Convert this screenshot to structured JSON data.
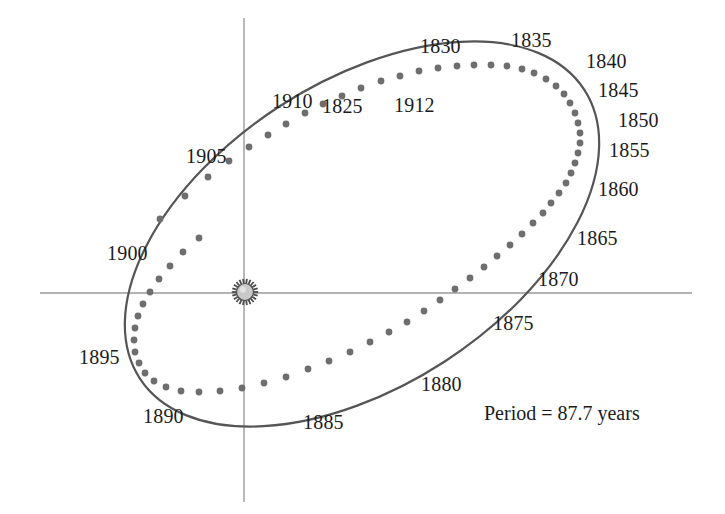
{
  "figure": {
    "background_color": "#ffffff",
    "axis_color": "#9a9a9a",
    "orbit_color": "#555555",
    "dot_color": "#6e6e6e",
    "text_color": "#1b1b1b",
    "sun_fill": "#c9c9c9",
    "sun_ray_color": "#4a4a4a"
  },
  "annotations": {
    "period": "Period = 87.7 years"
  },
  "icons": {
    "sun": "sun-icon"
  },
  "axes": {
    "horizontal": {
      "x1": 40,
      "y1": 293,
      "x2": 692,
      "y2": 293
    },
    "vertical": {
      "x1": 244,
      "y1": 18,
      "x2": 244,
      "y2": 502
    },
    "origin_label": "sun-at-focus"
  },
  "chart_data": {
    "type": "scatter",
    "subtitle": "Period = 87.7 years",
    "xlabel": "",
    "ylabel": "",
    "grid": false,
    "legend": null,
    "axis_style": "crosshair-through-focus",
    "focus_marker": {
      "name": "Sun",
      "x": 245,
      "y": 292,
      "symbol": "sun-icon"
    },
    "orbit_ellipse": {
      "center_x": 362,
      "center_y": 234,
      "semi_major": 265,
      "semi_minor": 152,
      "rotation_deg": -33,
      "leftmost": {
        "x": 133,
        "y": 330
      },
      "rightmost": {
        "x": 592,
        "y": 120
      },
      "topmost": {
        "x": 470,
        "y": 60
      },
      "bottommost": {
        "x": 250,
        "y": 407
      }
    },
    "year_labels": [
      {
        "year": "1825",
        "x": 322,
        "y": 96
      },
      {
        "year": "1830",
        "x": 420,
        "y": 36
      },
      {
        "year": "1835",
        "x": 511,
        "y": 30
      },
      {
        "year": "1840",
        "x": 586,
        "y": 51
      },
      {
        "year": "1845",
        "x": 598,
        "y": 80
      },
      {
        "year": "1850",
        "x": 618,
        "y": 110
      },
      {
        "year": "1855",
        "x": 609,
        "y": 140
      },
      {
        "year": "1860",
        "x": 598,
        "y": 179
      },
      {
        "year": "1865",
        "x": 577,
        "y": 228
      },
      {
        "year": "1870",
        "x": 538,
        "y": 269
      },
      {
        "year": "1875",
        "x": 493,
        "y": 313
      },
      {
        "year": "1880",
        "x": 421,
        "y": 374
      },
      {
        "year": "1885",
        "x": 303,
        "y": 412
      },
      {
        "year": "1890",
        "x": 143,
        "y": 406
      },
      {
        "year": "1895",
        "x": 79,
        "y": 347
      },
      {
        "year": "1900",
        "x": 107,
        "y": 243
      },
      {
        "year": "1905",
        "x": 186,
        "y": 146
      },
      {
        "year": "1910",
        "x": 272,
        "y": 91
      },
      {
        "year": "1912",
        "x": 394,
        "y": 95
      }
    ],
    "comet_positions_note": "Yearly comet positions along the elliptical orbit; dots are densely spaced near aphelion (right) and widely spaced near perihelion (left-bottom passage near the Sun).",
    "comet_dots": [
      [
        160,
        219
      ],
      [
        185,
        196
      ],
      [
        208,
        177
      ],
      [
        229,
        161
      ],
      [
        249,
        147
      ],
      [
        268,
        135
      ],
      [
        286,
        124
      ],
      [
        305,
        113
      ],
      [
        323,
        104
      ],
      [
        342,
        96
      ],
      [
        361,
        88
      ],
      [
        381,
        81
      ],
      [
        400,
        76
      ],
      [
        419,
        71
      ],
      [
        438,
        68
      ],
      [
        457,
        66
      ],
      [
        474,
        65
      ],
      [
        491,
        65
      ],
      [
        507,
        66
      ],
      [
        522,
        69
      ],
      [
        534,
        73
      ],
      [
        546,
        79
      ],
      [
        556,
        86
      ],
      [
        564,
        94
      ],
      [
        570,
        103
      ],
      [
        575,
        113
      ],
      [
        578,
        123
      ],
      [
        580,
        133
      ],
      [
        580,
        143
      ],
      [
        578,
        153
      ],
      [
        575,
        163
      ],
      [
        571,
        173
      ],
      [
        566,
        183
      ],
      [
        559,
        193
      ],
      [
        551,
        203
      ],
      [
        543,
        213
      ],
      [
        533,
        223
      ],
      [
        522,
        234
      ],
      [
        510,
        245
      ],
      [
        497,
        256
      ],
      [
        484,
        267
      ],
      [
        470,
        278
      ],
      [
        455,
        289
      ],
      [
        440,
        300
      ],
      [
        424,
        311
      ],
      [
        407,
        322
      ],
      [
        389,
        332
      ],
      [
        370,
        342
      ],
      [
        350,
        352
      ],
      [
        329,
        361
      ],
      [
        308,
        369
      ],
      [
        286,
        377
      ],
      [
        264,
        383
      ],
      [
        242,
        388
      ],
      [
        220,
        391
      ],
      [
        199,
        392
      ],
      [
        181,
        391
      ],
      [
        166,
        387
      ],
      [
        154,
        381
      ],
      [
        145,
        373
      ],
      [
        139,
        363
      ],
      [
        135,
        352
      ],
      [
        134,
        340
      ],
      [
        135,
        328
      ],
      [
        138,
        316
      ],
      [
        143,
        304
      ],
      [
        150,
        292
      ],
      [
        159,
        279
      ],
      [
        170,
        266
      ],
      [
        183,
        252
      ],
      [
        199,
        238
      ]
    ]
  }
}
